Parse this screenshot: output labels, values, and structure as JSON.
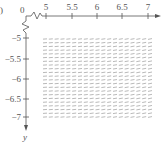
{
  "figure": {
    "part_label": ")",
    "origin_label": "0",
    "x_axis": {
      "ticks": [
        {
          "value": 5,
          "label": "5",
          "px": 46
        },
        {
          "value": 5.5,
          "label": "5.5",
          "px": 72
        },
        {
          "value": 6,
          "label": "6",
          "px": 97
        },
        {
          "value": 6.5,
          "label": "6.5",
          "px": 122
        },
        {
          "value": 7,
          "label": "7",
          "px": 148
        }
      ],
      "break": true
    },
    "y_axis": {
      "label": "y",
      "direction": "down",
      "ticks": [
        {
          "value": -5,
          "label": "−5",
          "px": 38
        },
        {
          "value": -5.5,
          "label": "−5.5",
          "px": 59
        },
        {
          "value": -6,
          "label": "−6",
          "px": 79
        },
        {
          "value": -6.5,
          "label": "−6.5",
          "px": 99
        },
        {
          "value": -7,
          "label": "−7",
          "px": 117
        }
      ],
      "break": true
    },
    "slope_field": {
      "x_range": [
        5,
        7
      ],
      "y_range": [
        -7,
        -5
      ],
      "columns": 19,
      "rows": 22,
      "segment_length_px": 4,
      "slope_note": "near-horizontal segments, slightly tilted",
      "color": "#8a8a8a"
    },
    "colors": {
      "axis": "#555555",
      "segment": "#8a8a8a"
    }
  }
}
